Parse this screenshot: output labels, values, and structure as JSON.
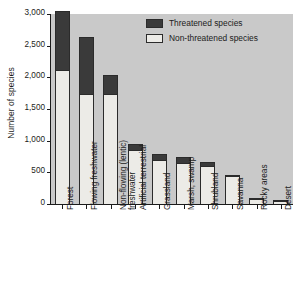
{
  "chart_data": {
    "type": "bar",
    "title": "",
    "subtitle": "",
    "xlabel": "",
    "ylabel": "Number of species",
    "ylim": [
      0,
      3000
    ],
    "yticks": [
      0,
      500,
      1000,
      1500,
      2000,
      2500,
      3000
    ],
    "ytick_labels": [
      "0",
      "500",
      "1,000",
      "1,500",
      "2,000",
      "2,500",
      "3,000"
    ],
    "grid": false,
    "stacked": true,
    "legend_position": "top-right",
    "categories": [
      "Forest",
      "Flowing freshwater",
      "Non-flowing (lentic) freshwater",
      "Artificial terrestrial",
      "Grassland",
      "Marsh, swamp",
      "Shrubland",
      "Savanna",
      "Rocky areas",
      "Desert"
    ],
    "category_lines": [
      [
        "Forest"
      ],
      [
        "Flowing freshwater"
      ],
      [
        "Non-flowing (lentic)",
        "freshwater"
      ],
      [
        "Artificial terrestrial"
      ],
      [
        "Grassland"
      ],
      [
        "Marsh, swamp"
      ],
      [
        "Shrubland"
      ],
      [
        "Savanna"
      ],
      [
        "Rocky areas"
      ],
      [
        "Desert"
      ]
    ],
    "series": [
      {
        "name": "Non-threatened species",
        "color": "#ecebe7",
        "values": [
          2110,
          1740,
          1740,
          850,
          700,
          650,
          605,
          450,
          75,
          50
        ]
      },
      {
        "name": "Threatened species",
        "color": "#3a3a3a",
        "values": [
          940,
          900,
          290,
          95,
          85,
          100,
          65,
          10,
          15,
          12
        ]
      }
    ],
    "totals": [
      3050,
      2640,
      2030,
      945,
      785,
      750,
      670,
      460,
      90,
      62
    ]
  },
  "legend": {
    "entries": [
      {
        "label": "Threatened species",
        "color": "#3a3a3a"
      },
      {
        "label": "Non-threatened species",
        "color": "#ecebe7"
      }
    ]
  },
  "colors": {
    "plot_background": "#c9c9c9",
    "page_background": "#ffffff",
    "axis": "#1b1b1b",
    "threatened": "#3a3a3a",
    "non_threatened": "#ecebe7"
  }
}
